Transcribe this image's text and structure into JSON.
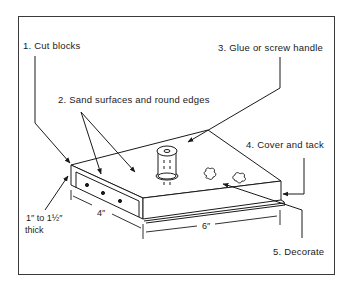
{
  "diagram": {
    "title": "",
    "steps": [
      {
        "number": "1.",
        "text": "Cut blocks"
      },
      {
        "number": "2.",
        "text": "Sand surfaces and round edges"
      },
      {
        "number": "3.",
        "text": "Glue or screw handle"
      },
      {
        "number": "4.",
        "text": "Cover and tack"
      },
      {
        "number": "5.",
        "text": "Decorate"
      }
    ],
    "dimensions": {
      "thickness_line1": "1″ to 1½″",
      "thickness_line2": "thick",
      "width": "4″",
      "length": "6″"
    },
    "colors": {
      "line": "#1a1a1a",
      "background": "#ffffff",
      "frame": "#3a3a3a"
    }
  }
}
